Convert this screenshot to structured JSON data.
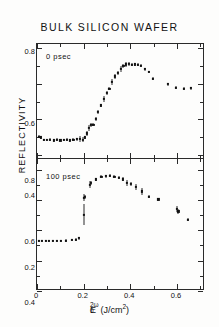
{
  "figure": {
    "title": "BULK  SILICON  WAFER",
    "ylabel": "REFLECTIVITY",
    "xlabel_base": "E",
    "xlabel_sub": "0",
    "xlabel_sup": "2ω",
    "xlabel_units": "(J/cm",
    "xlabel_units_sup": "2",
    "xlabel_units_close": ")",
    "panel_top_tag": "0 psec",
    "panel_bottom_tag": "100 psec",
    "ink_color": "#111111",
    "frame_color": "#2a2a2a",
    "background_color": "#fdfdfc"
  },
  "axes": {
    "x_ticks": [
      0,
      0.2,
      0.4,
      0.6
    ],
    "x_tick_labels": [
      "0",
      "0.2",
      "0.4",
      "0.6"
    ],
    "x_minor_ticks": [
      0.1,
      0.3,
      0.5,
      0.7
    ],
    "xlim": [
      0.0,
      0.72
    ],
    "top_y_ticks": [
      0.8,
      0.6,
      0.4,
      0.2
    ],
    "top_y_tick_labels": [
      "0.8",
      "0.6",
      "0.4",
      "0.2"
    ],
    "top_y_minor_ticks": [
      0.7,
      0.5,
      0.3
    ],
    "top_ylim": [
      0.18,
      0.82
    ],
    "bottom_y_ticks": [
      0.8,
      0.6,
      0.4,
      0.2,
      0.0
    ],
    "bottom_y_tick_labels": [
      "0.8",
      "0.6",
      "0.4",
      "0.2",
      "0"
    ],
    "bottom_y_minor_ticks": [
      0.7,
      0.5,
      0.3,
      0.1
    ],
    "bottom_ylim": [
      0.0,
      0.87
    ]
  },
  "chart_data": [
    {
      "type": "scatter",
      "title": "BULK SILICON WAFER",
      "panel": "0 psec",
      "xlabel": "E_0^2ω (J/cm^2)",
      "ylabel": "REFLECTIVITY",
      "xlim": [
        0.0,
        0.72
      ],
      "ylim": [
        0.18,
        0.82
      ],
      "grid": false,
      "legend": "none",
      "marker": "square",
      "x": [
        0.008,
        0.016,
        0.028,
        0.042,
        0.056,
        0.072,
        0.086,
        0.1,
        0.114,
        0.128,
        0.142,
        0.156,
        0.17,
        0.184,
        0.196,
        0.206,
        0.214,
        0.222,
        0.232,
        0.242,
        0.252,
        0.262,
        0.274,
        0.286,
        0.298,
        0.31,
        0.322,
        0.334,
        0.346,
        0.358,
        0.37,
        0.382,
        0.394,
        0.406,
        0.418,
        0.432,
        0.446,
        0.462,
        0.478,
        0.498,
        0.56,
        0.596,
        0.628,
        0.66
      ],
      "y": [
        0.305,
        0.3,
        0.288,
        0.286,
        0.288,
        0.284,
        0.288,
        0.284,
        0.286,
        0.288,
        0.284,
        0.288,
        0.29,
        0.292,
        0.288,
        0.3,
        0.322,
        0.352,
        0.368,
        0.372,
        0.404,
        0.44,
        0.478,
        0.514,
        0.548,
        0.572,
        0.61,
        0.64,
        0.658,
        0.68,
        0.698,
        0.706,
        0.708,
        0.704,
        0.706,
        0.704,
        0.698,
        0.68,
        0.664,
        0.628,
        0.596,
        0.576,
        0.57,
        0.574
      ],
      "yerr": [
        0.01,
        0.008,
        0.006,
        0.006,
        0.008,
        0.006,
        0.008,
        0.006,
        0.008,
        0.01,
        0.006,
        0.008,
        0.008,
        0.018,
        0.014,
        0.008,
        0.014,
        0.018,
        0.012,
        0.01,
        0.01,
        0.01,
        0.01,
        0.018,
        0.012,
        0.01,
        0.016,
        0.012,
        0.01,
        0.016,
        0.012,
        0.016,
        0.01,
        0.008,
        0.008,
        0.008,
        0.008,
        0.008,
        0.008,
        0.008,
        0.008,
        0.008,
        0.008,
        0.008
      ]
    },
    {
      "type": "scatter",
      "panel": "100 psec",
      "xlabel": "E_0^2ω (J/cm^2)",
      "ylabel": "REFLECTIVITY",
      "xlim": [
        0.0,
        0.72
      ],
      "ylim": [
        0.0,
        0.87
      ],
      "grid": false,
      "legend": "none",
      "marker": "square",
      "x": [
        0.008,
        0.022,
        0.038,
        0.052,
        0.068,
        0.086,
        0.104,
        0.124,
        0.148,
        0.168,
        0.18,
        0.2,
        0.202,
        0.206,
        0.226,
        0.232,
        0.252,
        0.276,
        0.296,
        0.314,
        0.332,
        0.352,
        0.368,
        0.386,
        0.404,
        0.424,
        0.448,
        0.478,
        0.52,
        0.6,
        0.606,
        0.648
      ],
      "y": [
        0.33,
        0.33,
        0.33,
        0.33,
        0.33,
        0.332,
        0.33,
        0.332,
        0.336,
        0.338,
        0.348,
        0.504,
        0.616,
        0.62,
        0.7,
        0.712,
        0.736,
        0.752,
        0.756,
        0.76,
        0.754,
        0.748,
        0.736,
        0.712,
        0.704,
        0.684,
        0.656,
        0.62,
        0.604,
        0.54,
        0.524,
        0.47
      ],
      "yerr": [
        0.006,
        0.006,
        0.006,
        0.006,
        0.006,
        0.006,
        0.006,
        0.008,
        0.008,
        0.01,
        0.01,
        0.072,
        0.026,
        0.016,
        0.022,
        0.012,
        0.01,
        0.01,
        0.008,
        0.01,
        0.008,
        0.012,
        0.014,
        0.02,
        0.014,
        0.018,
        0.022,
        0.01,
        0.01,
        0.02,
        0.014,
        0.01
      ]
    }
  ]
}
